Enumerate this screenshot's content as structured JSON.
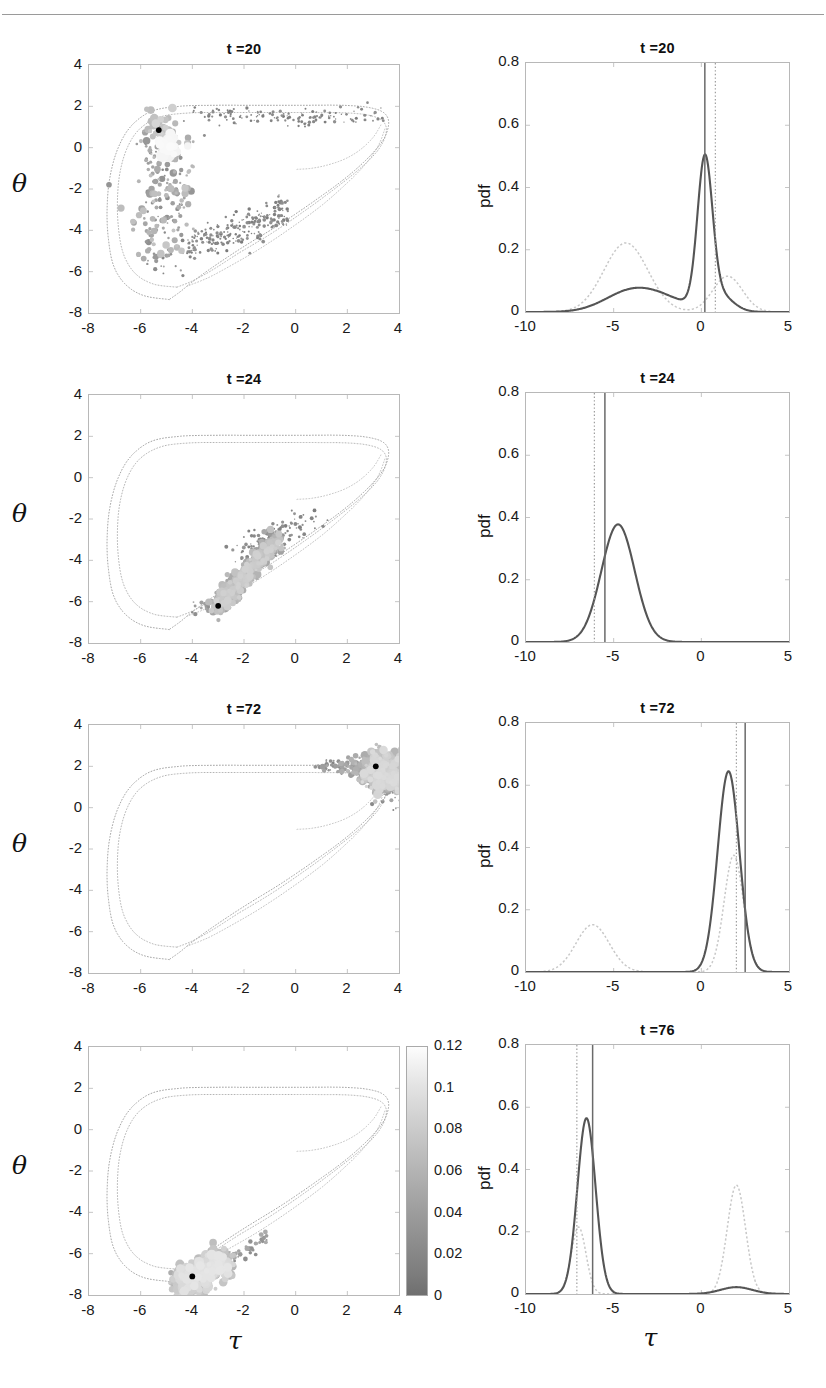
{
  "figure": {
    "left_column_xlabel": "τ",
    "left_column_ylabel": "θ",
    "right_column_xlabel": "τ",
    "right_column_ylabel": "pdf",
    "header_rule": true
  },
  "colorbar": {
    "name": "density-colorbar",
    "ticks": [
      "0.12",
      "0.1",
      "0.08",
      "0.06",
      "0.04",
      "0.02",
      "0"
    ],
    "min": 0,
    "max": 0.12,
    "low_color": "#6f6f6f",
    "high_color": "#fdfdfd"
  },
  "chart_data": [
    {
      "type": "scatter",
      "panel": "phase-space-t20",
      "title": "t =20",
      "xlabel": "τ",
      "ylabel": "θ",
      "xlim": [
        -8,
        4
      ],
      "ylim": [
        -8,
        4
      ],
      "xticks": [
        -8,
        -6,
        -4,
        -2,
        0,
        2,
        4
      ],
      "yticks": [
        -8,
        -6,
        -4,
        -2,
        0,
        2,
        4
      ],
      "grid": false,
      "colorbar_variable": "density",
      "marker_black_point": [
        -5.3,
        0.85
      ],
      "notes": "Ensemble of particles on a chaotic attractor; marker size/shade encode probability density 0 to 0.12."
    },
    {
      "type": "line",
      "panel": "pdf-t20",
      "title": "t =20",
      "xlabel": "τ",
      "ylabel": "pdf",
      "xlim": [
        -10,
        5
      ],
      "ylim": [
        0,
        0.8
      ],
      "xticks": [
        -10,
        -5,
        0,
        5
      ],
      "yticks": [
        0,
        0.2,
        0.4,
        0.6,
        0.8
      ],
      "grid": false,
      "series": [
        {
          "name": "posterior-pdf",
          "style": "solid-dark",
          "peaks": [
            {
              "x": -4.2,
              "y": 0.058
            },
            {
              "x": 0.2,
              "y": 0.465
            }
          ]
        },
        {
          "name": "prior-pdf",
          "style": "dashed-light",
          "peaks": [
            {
              "x": -4.3,
              "y": 0.225
            },
            {
              "x": 1.5,
              "y": 0.12
            }
          ]
        }
      ],
      "vlines": [
        {
          "name": "truth-solid",
          "x": 0.2,
          "style": "solid"
        },
        {
          "name": "estimate-dotted",
          "x": 0.8,
          "style": "dotted"
        }
      ]
    },
    {
      "type": "scatter",
      "panel": "phase-space-t24",
      "title": "t =24",
      "xlabel": "τ",
      "ylabel": "θ",
      "xlim": [
        -8,
        4
      ],
      "ylim": [
        -8,
        4
      ],
      "xticks": [
        -8,
        -6,
        -4,
        -2,
        0,
        2,
        4
      ],
      "yticks": [
        -8,
        -6,
        -4,
        -2,
        0,
        2,
        4
      ],
      "grid": false,
      "marker_black_point": [
        -3.0,
        -6.2
      ],
      "notes": "Cloud collapsed onto the lower-right branch between τ=-3.2 and τ=0."
    },
    {
      "type": "line",
      "panel": "pdf-t24",
      "title": "t =24",
      "xlabel": "τ",
      "ylabel": "pdf",
      "xlim": [
        -10,
        5
      ],
      "ylim": [
        0,
        0.8
      ],
      "xticks": [
        -10,
        -5,
        0,
        5
      ],
      "yticks": [
        0,
        0.2,
        0.4,
        0.6,
        0.8
      ],
      "grid": false,
      "series": [
        {
          "name": "posterior-pdf",
          "style": "solid-dark",
          "peaks": [
            {
              "x": -4.8,
              "y": 0.378
            }
          ]
        }
      ],
      "vlines": [
        {
          "name": "estimate-dotted",
          "x": -6.1,
          "style": "dotted"
        },
        {
          "name": "truth-solid",
          "x": -5.5,
          "style": "solid"
        }
      ]
    },
    {
      "type": "scatter",
      "panel": "phase-space-t72",
      "title": "t =72",
      "xlabel": "τ",
      "ylabel": "θ",
      "xlim": [
        -8,
        4
      ],
      "ylim": [
        -8,
        4
      ],
      "xticks": [
        -8,
        -6,
        -4,
        -2,
        0,
        2,
        4
      ],
      "yticks": [
        -8,
        -6,
        -4,
        -2,
        0,
        2,
        4
      ],
      "grid": false,
      "marker_black_point": [
        3.1,
        2.0
      ],
      "notes": "Ensemble concentrated near the right turning point τ≈3 to 4, θ≈1 to 2."
    },
    {
      "type": "line",
      "panel": "pdf-t72",
      "title": "t =72",
      "xlabel": "τ",
      "ylabel": "pdf",
      "xlim": [
        -10,
        5
      ],
      "ylim": [
        0,
        0.8
      ],
      "xticks": [
        -10,
        -5,
        0,
        5
      ],
      "yticks": [
        0,
        0.2,
        0.4,
        0.6,
        0.8
      ],
      "grid": false,
      "series": [
        {
          "name": "posterior-pdf",
          "style": "solid-dark",
          "peaks": [
            {
              "x": 1.55,
              "y": 0.645
            }
          ]
        },
        {
          "name": "prior-pdf",
          "style": "dashed-light",
          "peaks": [
            {
              "x": -6.2,
              "y": 0.152
            },
            {
              "x": 1.8,
              "y": 0.38
            }
          ]
        }
      ],
      "vlines": [
        {
          "name": "estimate-dotted",
          "x": 2.0,
          "style": "dotted"
        },
        {
          "name": "truth-solid",
          "x": 2.5,
          "style": "solid"
        }
      ]
    },
    {
      "type": "scatter",
      "panel": "phase-space-t76",
      "title": "",
      "xlabel": "τ",
      "ylabel": "θ",
      "xlim": [
        -8,
        4
      ],
      "ylim": [
        -8,
        4
      ],
      "xticks": [
        -8,
        -6,
        -4,
        -2,
        0,
        2,
        4
      ],
      "yticks": [
        -8,
        -6,
        -4,
        -2,
        0,
        2,
        4
      ],
      "grid": false,
      "marker_black_point": [
        -4.0,
        -7.1
      ],
      "notes": "Ensemble collapsed to the bottom-left lobe near τ≈-4, θ≈-7."
    },
    {
      "type": "line",
      "panel": "pdf-t76",
      "title": "t =76",
      "xlabel": "τ",
      "ylabel": "pdf",
      "xlim": [
        -10,
        5
      ],
      "ylim": [
        0,
        0.8
      ],
      "xticks": [
        -10,
        -5,
        0,
        5
      ],
      "yticks": [
        0,
        0.2,
        0.4,
        0.6,
        0.8
      ],
      "grid": false,
      "series": [
        {
          "name": "posterior-pdf",
          "style": "solid-dark",
          "peaks": [
            {
              "x": -6.55,
              "y": 0.568
            },
            {
              "x": 2.0,
              "y": 0.022
            }
          ]
        },
        {
          "name": "prior-pdf",
          "style": "dashed-light",
          "peaks": [
            {
              "x": -7.0,
              "y": 0.218
            },
            {
              "x": 2.0,
              "y": 0.352
            }
          ]
        }
      ],
      "vlines": [
        {
          "name": "estimate-dotted",
          "x": -7.1,
          "style": "dotted"
        },
        {
          "name": "truth-solid",
          "x": -6.2,
          "style": "solid"
        }
      ]
    }
  ]
}
